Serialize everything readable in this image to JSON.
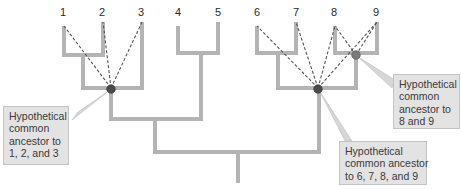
{
  "diagram": {
    "type": "phylogenetic-tree",
    "taxa": [
      "1",
      "2",
      "3",
      "4",
      "5",
      "6",
      "7",
      "8",
      "9"
    ],
    "branch_color": "#b4b4b4",
    "node_colors": {
      "dark": "#4a4a4a",
      "light": "#7a7a7a"
    },
    "nodes": [
      {
        "id": "ancestor-123",
        "descendants": [
          "1",
          "2",
          "3"
        ]
      },
      {
        "id": "ancestor-6789",
        "descendants": [
          "6",
          "7",
          "8",
          "9"
        ]
      },
      {
        "id": "ancestor-89",
        "descendants": [
          "8",
          "9"
        ]
      }
    ],
    "callouts": [
      {
        "id": "ancestor-123",
        "lines": [
          "Hypothetical",
          "common",
          "ancestor to",
          "1, 2, and 3"
        ]
      },
      {
        "id": "ancestor-89",
        "lines": [
          "Hypothetical",
          "common",
          "ancestor to",
          "8 and 9"
        ]
      },
      {
        "id": "ancestor-6789",
        "lines": [
          "Hypothetical",
          "common ancestor",
          "to 6, 7, 8, and 9"
        ]
      }
    ]
  }
}
